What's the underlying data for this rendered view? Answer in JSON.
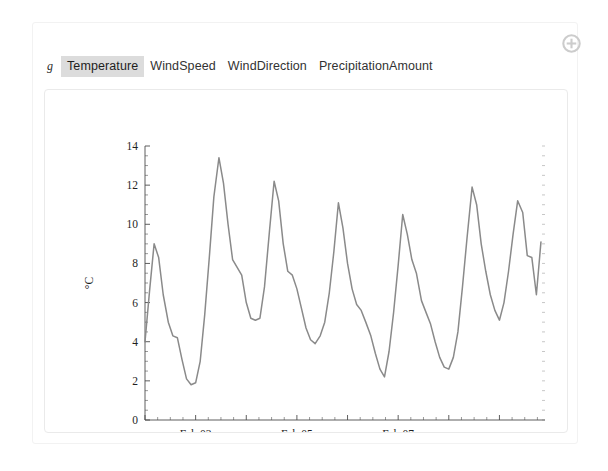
{
  "window": {
    "background": "#ffffff",
    "card_border": "#f2f2f2"
  },
  "toolbar": {
    "add_button_name": "add-panel-button",
    "add_icon": "plus-circle-icon",
    "add_icon_color": "#c9c9c9"
  },
  "tabs": {
    "variable_label": "g",
    "items": [
      {
        "label": "Temperature",
        "selected": true
      },
      {
        "label": "WindSpeed",
        "selected": false
      },
      {
        "label": "WindDirection",
        "selected": false
      },
      {
        "label": "PrecipitationAmount",
        "selected": false
      }
    ],
    "selected_background": "#dcdcdc"
  },
  "chart_data": {
    "type": "line",
    "title": "",
    "subtitle": "",
    "xlabel": "",
    "ylabel": "°C",
    "ylim": [
      0,
      14
    ],
    "yticks": [
      0,
      2,
      4,
      6,
      8,
      10,
      12,
      14
    ],
    "yticklabels": [
      "0",
      "2",
      "4",
      "6",
      "8",
      "10",
      "12",
      "14"
    ],
    "y_minor_step": 0.5,
    "xlim": [
      0,
      7.9
    ],
    "xticks": [
      1.0,
      3.0,
      5.0
    ],
    "xticklabels": [
      "Feb 03",
      "Feb 05",
      "Feb 07"
    ],
    "x_major_step": 1.0,
    "x_minor_step": 0.25,
    "grid": false,
    "legend": false,
    "line_color": "#8a8a8a",
    "line_width": 1.5,
    "series": [
      {
        "name": "Temperature",
        "units": "°C",
        "x": [
          0.0,
          0.09,
          0.18,
          0.27,
          0.36,
          0.46,
          0.55,
          0.64,
          0.73,
          0.82,
          0.91,
          1.0,
          1.09,
          1.18,
          1.27,
          1.36,
          1.46,
          1.55,
          1.64,
          1.73,
          1.82,
          1.91,
          2.0,
          2.09,
          2.18,
          2.27,
          2.36,
          2.46,
          2.55,
          2.64,
          2.73,
          2.82,
          2.91,
          3.0,
          3.09,
          3.18,
          3.27,
          3.36,
          3.46,
          3.55,
          3.64,
          3.73,
          3.82,
          3.91,
          4.0,
          4.09,
          4.18,
          4.27,
          4.36,
          4.46,
          4.55,
          4.64,
          4.73,
          4.82,
          4.91,
          5.0,
          5.09,
          5.18,
          5.27,
          5.36,
          5.46,
          5.55,
          5.64,
          5.73,
          5.82,
          5.91,
          6.0,
          6.09,
          6.18,
          6.27,
          6.36,
          6.46,
          6.55,
          6.64,
          6.73,
          6.82,
          6.91,
          7.0,
          7.09,
          7.18,
          7.27,
          7.36,
          7.46,
          7.55,
          7.64,
          7.73,
          7.82
        ],
        "y": [
          4.0,
          6.6,
          9.0,
          8.3,
          6.4,
          5.0,
          4.3,
          4.2,
          3.1,
          2.1,
          1.8,
          1.9,
          3.0,
          5.4,
          8.3,
          11.4,
          13.4,
          12.1,
          10.0,
          8.2,
          7.8,
          7.4,
          6.0,
          5.2,
          5.1,
          5.2,
          6.8,
          9.7,
          12.2,
          11.2,
          9.0,
          7.6,
          7.4,
          6.7,
          5.7,
          4.7,
          4.1,
          3.9,
          4.3,
          5.0,
          6.5,
          8.6,
          11.1,
          9.8,
          8.0,
          6.7,
          5.9,
          5.6,
          5.0,
          4.3,
          3.4,
          2.6,
          2.2,
          3.5,
          5.5,
          7.9,
          10.5,
          9.5,
          8.2,
          7.5,
          6.1,
          5.5,
          4.9,
          4.0,
          3.2,
          2.7,
          2.6,
          3.2,
          4.5,
          6.8,
          9.3,
          11.9,
          11.0,
          9.0,
          7.6,
          6.4,
          5.6,
          5.1,
          6.0,
          7.6,
          9.5,
          11.2,
          10.6,
          8.4,
          8.3,
          6.4,
          9.1
        ]
      }
    ]
  }
}
